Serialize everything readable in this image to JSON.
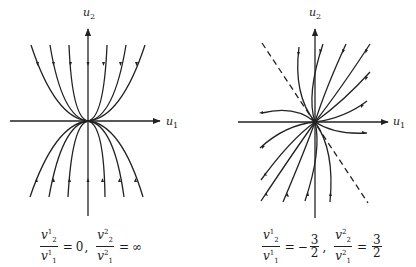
{
  "figure": {
    "left": {
      "axis_x_label": "u",
      "axis_x_sub": "1",
      "axis_y_label": "u",
      "axis_y_sub": "2",
      "formula": {
        "a_num": "v",
        "a_num_sup": "1",
        "a_num_sub": "2",
        "a_den": "v",
        "a_den_sup": "1",
        "a_den_sub": "1",
        "a_eq": "=",
        "a_val": "0",
        "sep": ",",
        "b_num": "v",
        "b_num_sup": "2",
        "b_num_sub": "2",
        "b_den": "v",
        "b_den_sup": "2",
        "b_den_sub": "1",
        "b_eq": "=",
        "b_val": "∞"
      },
      "description": "Phase portrait: parabolic trajectories tangent to u1 axis at origin; upper arrows point toward origin, lower arrows point toward origin"
    },
    "right": {
      "axis_x_label": "u",
      "axis_x_sub": "1",
      "axis_y_label": "u",
      "axis_y_sub": "2",
      "formula": {
        "a_num": "v",
        "a_num_sup": "1",
        "a_num_sub": "2",
        "a_den": "v",
        "a_den_sup": "1",
        "a_den_sub": "1",
        "a_eq": "=",
        "a_val_num": "3",
        "a_val_den": "2",
        "a_sign": "−",
        "sep": ",",
        "b_num": "v",
        "b_num_sup": "2",
        "b_num_sub": "2",
        "b_den": "v",
        "b_den_sup": "2",
        "b_den_sub": "1",
        "b_eq": "=",
        "b_val_num": "3",
        "b_val_den": "2"
      },
      "description": "Phase portrait with dashed eigen-direction line of slope -3/2 and trajectories curving through origin"
    }
  },
  "colors": {
    "stroke": "#222222",
    "background": "#ffffff"
  }
}
